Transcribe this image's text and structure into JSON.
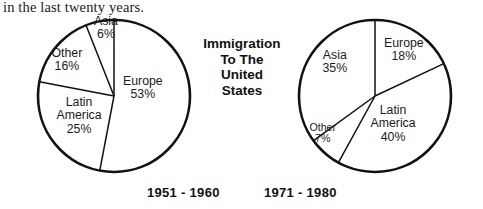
{
  "caption": {
    "text": "in the last twenty years."
  },
  "title": {
    "line1": "Immigration",
    "line2": "To The",
    "line3": "United",
    "line4": "States"
  },
  "colors": {
    "stroke": "#111111",
    "fill": "#ffffff",
    "text": "#1b1b1b"
  },
  "charts": [
    {
      "id": "pie-1951-1960",
      "period_label": "1951 - 1960",
      "center": {
        "x": 114,
        "y": 96
      },
      "radius": 76,
      "labels": [
        {
          "name": "Europe",
          "value": "53%",
          "x": 143,
          "y": 88
        },
        {
          "name": "Latin America",
          "value": "25%",
          "x": 79,
          "y": 116,
          "two_line": true
        },
        {
          "name": "Other",
          "value": "16%",
          "x": 67,
          "y": 60
        },
        {
          "name": "Asia",
          "value": "6%",
          "x": 106,
          "y": 28
        }
      ]
    },
    {
      "id": "pie-1971-1980",
      "period_label": "1971 - 1980",
      "center": {
        "x": 375,
        "y": 96
      },
      "radius": 76,
      "labels": [
        {
          "name": "Europe",
          "value": "18%",
          "x": 404,
          "y": 50
        },
        {
          "name": "Latin America",
          "value": "40%",
          "x": 393,
          "y": 124,
          "two_line": true
        },
        {
          "name": "Other",
          "value": "7%",
          "x": 323,
          "y": 133,
          "tiny": true
        },
        {
          "name": "Asia",
          "value": "35%",
          "x": 335,
          "y": 62
        }
      ]
    }
  ],
  "chart_data": [
    {
      "type": "pie",
      "title": "Immigration To The United States",
      "subtitle": "1951 - 1960",
      "labels": [
        "Europe",
        "Latin America",
        "Other",
        "Asia"
      ],
      "values": [
        53,
        25,
        16,
        6
      ],
      "unit": "percent",
      "start_angle": 0,
      "direction": "clockwise",
      "legend": "none",
      "grid": false,
      "data_labels": [
        "Europe 53%",
        "Latin America 25%",
        "Other 16%",
        "Asia 6%"
      ]
    },
    {
      "type": "pie",
      "title": "Immigration To The United States",
      "subtitle": "1971 - 1980",
      "labels": [
        "Europe",
        "Latin America",
        "Other",
        "Asia"
      ],
      "values": [
        18,
        40,
        7,
        35
      ],
      "unit": "percent",
      "start_angle": 0,
      "direction": "clockwise",
      "legend": "none",
      "grid": false,
      "data_labels": [
        "Europe 18%",
        "Latin America 40%",
        "Other 7%",
        "Asia 35%"
      ]
    }
  ]
}
